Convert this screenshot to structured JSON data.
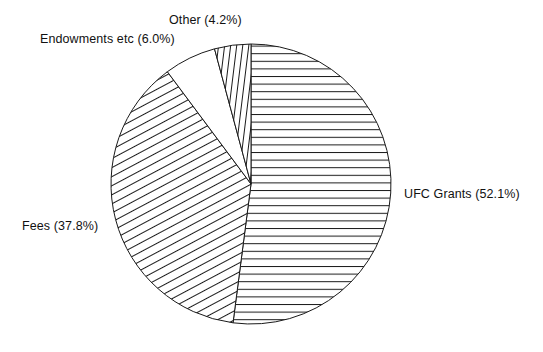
{
  "chart_data": {
    "type": "pie",
    "title": "",
    "subtitle": "",
    "xlabel": "",
    "ylabel": "",
    "legend_position": "none",
    "grid": false,
    "start_angle_deg": -90,
    "direction": "clockwise",
    "units": "percent",
    "categories": [
      "UFC Grants",
      "Fees",
      "Endowments etc",
      "Other"
    ],
    "values": [
      52.1,
      37.8,
      6.0,
      4.2
    ],
    "slices": [
      {
        "name": "UFC Grants",
        "value": 52.1,
        "label": "UFC Grants (52.1%)",
        "percent_text": "52.1%",
        "fill": "horizontal-hatch",
        "stroke": "#1a1a1a",
        "label_position": "right"
      },
      {
        "name": "Fees",
        "value": 37.8,
        "label": "Fees (37.8%)",
        "percent_text": "37.8%",
        "fill": "diagonal-hatch",
        "stroke": "#1a1a1a",
        "label_position": "left"
      },
      {
        "name": "Endowments etc",
        "value": 6.0,
        "label": "Endowments etc (6.0%)",
        "percent_text": "6.0%",
        "fill": "none",
        "stroke": "#1a1a1a",
        "label_position": "upper-left"
      },
      {
        "name": "Other",
        "value": 4.2,
        "label": "Other (4.2%)",
        "percent_text": "4.2%",
        "fill": "vertical-hatch",
        "stroke": "#1a1a1a",
        "label_position": "top"
      }
    ],
    "geometry": {
      "center_x": 251,
      "center_y": 184,
      "radius": 140
    },
    "colors": {
      "background": "#ffffff",
      "stroke": "#1a1a1a",
      "text": "#111111"
    }
  }
}
